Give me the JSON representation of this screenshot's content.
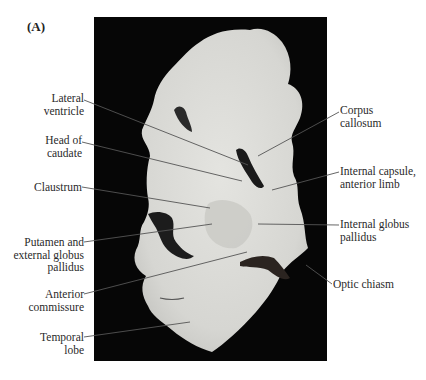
{
  "figure": {
    "panel_letter": "(A)",
    "background": "#ffffff",
    "photo_background": "#060606",
    "tissue_color": "#dcdcd8",
    "leader_color": "#555555",
    "labels_left": [
      {
        "id": "lateral-ventricle",
        "lines": [
          "Lateral",
          "ventricle"
        ]
      },
      {
        "id": "head-of-caudate",
        "lines": [
          "Head of",
          "caudate"
        ]
      },
      {
        "id": "claustrum",
        "lines": [
          "Claustrum"
        ]
      },
      {
        "id": "putamen",
        "lines": [
          "Putamen and",
          "external globus",
          "pallidus"
        ]
      },
      {
        "id": "anterior-commissure",
        "lines": [
          "Anterior",
          "commissure"
        ]
      },
      {
        "id": "temporal-lobe",
        "lines": [
          "Temporal",
          "lobe"
        ]
      }
    ],
    "labels_right": [
      {
        "id": "corpus-callosum",
        "lines": [
          "Corpus",
          "callosum"
        ]
      },
      {
        "id": "internal-capsule",
        "lines": [
          "Internal capsule,",
          "anterior limb"
        ]
      },
      {
        "id": "internal-globus-pallidus",
        "lines": [
          "Internal globus",
          "pallidus"
        ]
      },
      {
        "id": "optic-chiasm",
        "lines": [
          "Optic chiasm"
        ]
      }
    ]
  }
}
